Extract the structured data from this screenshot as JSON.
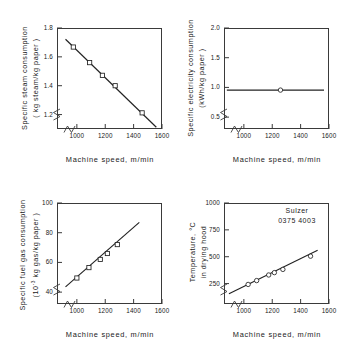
{
  "figure": {
    "annotation": {
      "line1": "Sulzer",
      "line2": "0375 4003"
    }
  },
  "chart_data": [
    {
      "id": "steam",
      "type": "line",
      "title": "",
      "ylabel_line1": "Specific steam consumption",
      "ylabel_line2": "( kg steam/kg paper )",
      "xlabel": "Machine speed,   m/min",
      "xlim": [
        860,
        1600
      ],
      "ylim": [
        1.1,
        1.8
      ],
      "xticks": [
        1000,
        1200,
        1400,
        1600
      ],
      "xticklabels": [
        "1000",
        "1200",
        "1400",
        "1600"
      ],
      "yticks": [
        1.2,
        1.4,
        1.6,
        1.8
      ],
      "yticklabels": [
        "1.2",
        "1.4",
        "1.6",
        "1.8"
      ],
      "axis_break_x": true,
      "axis_break_y": true,
      "grid": false,
      "marker": "open-square",
      "fit_line": {
        "x": [
          920,
          1560
        ],
        "y": [
          1.722,
          1.112
        ]
      },
      "points": [
        {
          "x": 975,
          "y": 1.668
        },
        {
          "x": 1090,
          "y": 1.56
        },
        {
          "x": 1180,
          "y": 1.472
        },
        {
          "x": 1270,
          "y": 1.4
        },
        {
          "x": 1460,
          "y": 1.212
        }
      ]
    },
    {
      "id": "electricity",
      "type": "line",
      "title": "",
      "ylabel_line1": "Specific electricity consumption",
      "ylabel_line2": "(kWh/kg paper )",
      "xlabel": "Machine speed,   m/min",
      "xlim": [
        860,
        1600
      ],
      "ylim": [
        0.3,
        2.0
      ],
      "xticks": [
        1000,
        1200,
        1400,
        1600
      ],
      "xticklabels": [
        "1000",
        "1200",
        "1400",
        "1600"
      ],
      "yticks": [
        0.5,
        1.0,
        1.5,
        2.0
      ],
      "yticklabels": [
        "0.5",
        "1.0",
        "1.5",
        "2.0"
      ],
      "axis_break_x": true,
      "axis_break_y": true,
      "grid": false,
      "marker": "open-circle",
      "fit_line": {
        "x": [
          880,
          1565
        ],
        "y": [
          0.955,
          0.955
        ]
      },
      "points": [
        {
          "x": 1258,
          "y": 0.955
        }
      ]
    },
    {
      "id": "fuelgas",
      "type": "line",
      "title": "",
      "ylabel_line1": "Specific fuel gas consumption",
      "ylabel_line2": "(10-3 kg gas/kg paper )",
      "ylabel_exponent": "-3",
      "xlabel": "Machine speed,   m/min",
      "xlim": [
        860,
        1600
      ],
      "ylim": [
        32,
        100
      ],
      "xticks": [
        1000,
        1200,
        1400,
        1600
      ],
      "xticklabels": [
        "1000",
        "1200",
        "1400",
        "1600"
      ],
      "yticks": [
        40,
        60,
        80,
        100
      ],
      "yticklabels": [
        "40",
        "60",
        "80",
        "100"
      ],
      "axis_break_x": true,
      "axis_break_y": true,
      "grid": false,
      "marker": "open-square",
      "fit_line": {
        "x": [
          920,
          1440
        ],
        "y": [
          43.5,
          87.0
        ]
      },
      "points": [
        {
          "x": 1000,
          "y": 49.5
        },
        {
          "x": 1085,
          "y": 56.5
        },
        {
          "x": 1165,
          "y": 62.0
        },
        {
          "x": 1215,
          "y": 66.0
        },
        {
          "x": 1285,
          "y": 72.0
        }
      ]
    },
    {
      "id": "temperature",
      "type": "line",
      "title": "",
      "ylabel_line1": "Temperature,  °C",
      "ylabel_line2": "in drying hood",
      "xlabel": "Machine speed,   m/min",
      "xlim": [
        860,
        1600
      ],
      "ylim": [
        60,
        1000
      ],
      "xticks": [
        1000,
        1200,
        1400,
        1600
      ],
      "xticklabels": [
        "1000",
        "1200",
        "1400",
        "1600"
      ],
      "yticks": [
        250,
        500,
        750,
        1000
      ],
      "yticklabels": [
        "250",
        "500",
        "750",
        "1000"
      ],
      "axis_break_x": true,
      "axis_break_y": true,
      "grid": false,
      "marker": "open-circle",
      "annotation_line1": "Sulzer",
      "annotation_line2": "0375 4003",
      "fit_line": {
        "x": [
          895,
          1520
        ],
        "y": [
          155,
          560
        ]
      },
      "points": [
        {
          "x": 1030,
          "y": 242
        },
        {
          "x": 1090,
          "y": 278
        },
        {
          "x": 1175,
          "y": 330
        },
        {
          "x": 1215,
          "y": 352
        },
        {
          "x": 1275,
          "y": 382
        },
        {
          "x": 1470,
          "y": 505
        }
      ]
    }
  ]
}
